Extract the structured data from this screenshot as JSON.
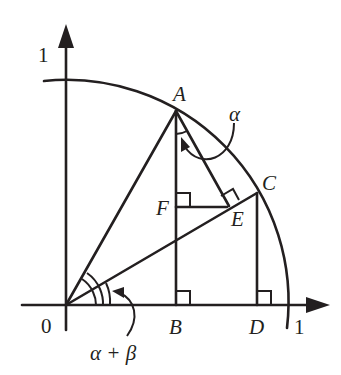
{
  "diagram": {
    "labels": {
      "y_axis_tick": "1",
      "x_axis_tick": "1",
      "origin": "0",
      "A": "A",
      "B": "B",
      "C": "C",
      "D": "D",
      "E": "E",
      "F": "F",
      "alpha": "α",
      "alpha_plus_beta": "α + β"
    },
    "points": {
      "O": [
        66,
        305
      ],
      "A": [
        176,
        111
      ],
      "B": [
        176,
        305
      ],
      "C": [
        257,
        193
      ],
      "D": [
        257,
        305
      ],
      "E": [
        227,
        207
      ],
      "F": [
        176,
        207
      ]
    },
    "segments": [
      "OA",
      "OC",
      "AB",
      "CD",
      "AE",
      "FE"
    ],
    "right_angles": [
      "F",
      "E",
      "B",
      "D"
    ],
    "arc": {
      "center": "O",
      "radius": 222,
      "from_deg": 95,
      "to_deg": -6
    },
    "stroke_color": "#231f20",
    "background_color": "#ffffff"
  }
}
